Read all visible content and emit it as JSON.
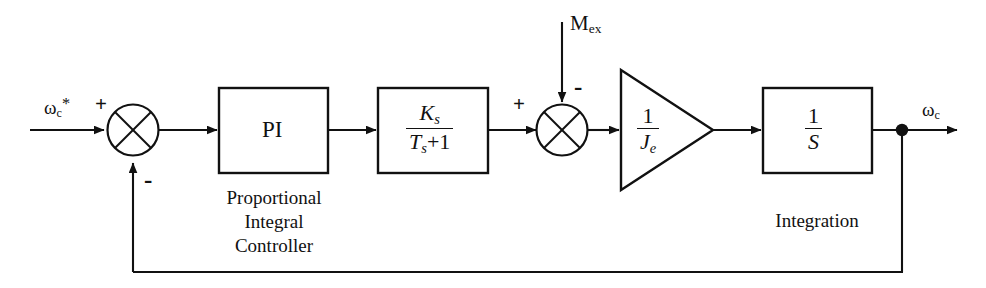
{
  "diagram": {
    "type": "control-system-block-diagram",
    "line_color": "#111111",
    "background_color": "#ffffff"
  },
  "signals": {
    "reference_input": {
      "base": "ω",
      "sub": "c",
      "sup": "*",
      "text": "ωc*"
    },
    "disturbance_input": {
      "base": "M",
      "sub": "ex",
      "text": "Mex"
    },
    "output": {
      "base": "ω",
      "sub": "c",
      "text": "ωc"
    }
  },
  "summing_junctions": [
    {
      "name": "error-summing-junction",
      "input_signs": {
        "left": "+",
        "bottom": "-"
      }
    },
    {
      "name": "torque-summing-junction",
      "input_signs": {
        "left": "+",
        "top": "-"
      }
    }
  ],
  "blocks": [
    {
      "name": "pi-controller-block",
      "shape": "rectangle",
      "label": "PI",
      "caption_lines": [
        "Proportional",
        "Integral",
        "Controller"
      ]
    },
    {
      "name": "first-order-lag-block",
      "shape": "rectangle",
      "numerator": "K",
      "numerator_sub": "s",
      "denominator": "T",
      "denominator_sub": "s",
      "denominator_tail": "+1",
      "label": "Ks/(Ts+1)",
      "caption_lines": []
    },
    {
      "name": "inertia-gain-block",
      "shape": "triangle",
      "numerator": "1",
      "denominator": "J",
      "denominator_sub": "e",
      "label": "1/Je",
      "caption_lines": []
    },
    {
      "name": "integrator-block",
      "shape": "rectangle",
      "numerator": "1",
      "denominator": "S",
      "label": "1/S",
      "caption_lines": [
        "Integration"
      ]
    }
  ],
  "feedback": {
    "name": "unity-feedback-path",
    "sign": "-",
    "tap_point": "output-node"
  }
}
